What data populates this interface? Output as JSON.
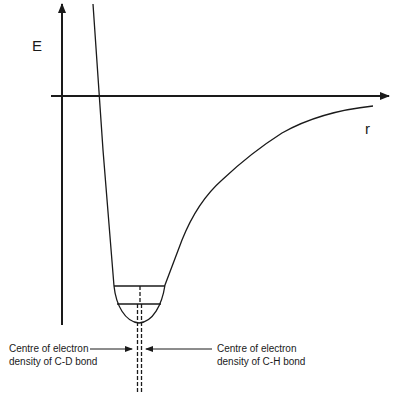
{
  "diagram": {
    "axes": {
      "y_label": "E",
      "x_label": "r"
    },
    "annotations": {
      "cd_bond": {
        "line1": "Centre of electron",
        "line2": "density of C-D bond"
      },
      "ch_bond": {
        "line1": "Centre of electron",
        "line2": "density of C-H bond"
      }
    },
    "energy_levels": [
      {
        "name": "C-H zero-point level",
        "y": 286,
        "x1": 114,
        "x2": 165
      },
      {
        "name": "C-D zero-point level",
        "y": 304,
        "x1": 117,
        "x2": 161
      }
    ],
    "colors": {
      "line": "#1a1a1a",
      "background": "#ffffff"
    }
  }
}
